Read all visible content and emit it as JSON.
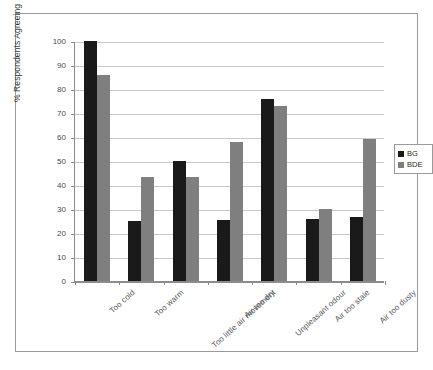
{
  "chart_data": {
    "type": "bar",
    "title": "",
    "xlabel": "",
    "ylabel": "% Respondents Agreeing",
    "ylim": [
      0,
      100
    ],
    "ytick_values": [
      0,
      10,
      20,
      30,
      40,
      50,
      60,
      70,
      80,
      90,
      100
    ],
    "ytick_labels": [
      "0",
      "10",
      "20",
      "30",
      "40",
      "50",
      "60",
      "70",
      "80",
      "90",
      "100"
    ],
    "grid": "horizontal",
    "legend_position": "right",
    "categories": [
      "Too cold",
      "Too warm",
      "Too little air movement",
      "Air too dry",
      "Unpleasant odour",
      "Air too stale",
      "Air too dusty"
    ],
    "series": [
      {
        "name": "BG",
        "color": "#1a1a1a",
        "values": [
          100,
          25,
          50,
          25.5,
          76,
          26,
          26.5
        ]
      },
      {
        "name": "BDE",
        "color": "#7f7f7f",
        "values": [
          86,
          43.5,
          43.5,
          58,
          73,
          30,
          59
        ]
      }
    ]
  },
  "legend": {
    "entries": [
      {
        "label": "BG"
      },
      {
        "label": "BDE"
      }
    ]
  },
  "colors": {
    "series_bg": "#1a1a1a",
    "series_bde": "#7f7f7f",
    "gridline": "#c9c9c9",
    "axis": "#8c8c8c",
    "frame": "#9a9a9a",
    "background": "#ffffff"
  }
}
